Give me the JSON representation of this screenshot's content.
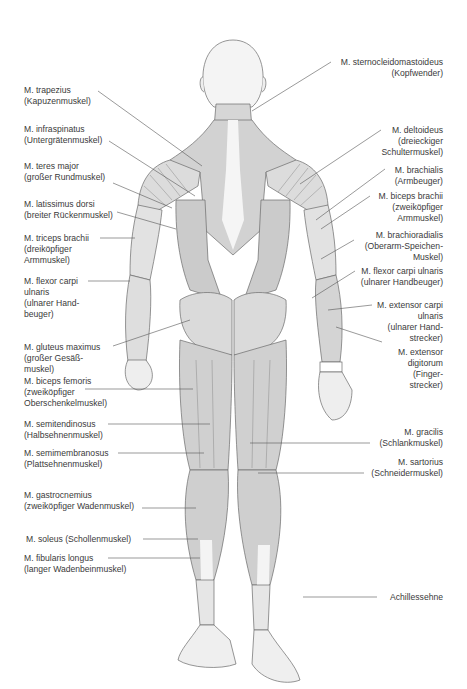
{
  "diagram": {
    "line_color": "#555555",
    "muscle_fill_dark": "#c9c9c9",
    "muscle_fill_light": "#e4e4e4",
    "skin_fill": "#f2f2f2",
    "labels_left": [
      {
        "id": "trapezius",
        "latin": "M. trapezius",
        "german": [
          "(Kapuzenmuskel)"
        ]
      },
      {
        "id": "infraspinatus",
        "latin": "M. infraspinatus",
        "german": [
          "(Untergrätenmuskel)"
        ]
      },
      {
        "id": "teres-major",
        "latin": "M. teres major",
        "german": [
          "(großer Rundmuskel)"
        ]
      },
      {
        "id": "latissimus-dorsi",
        "latin": "M. latissimus dorsi",
        "german": [
          "(breiter Rückenmuskel)"
        ]
      },
      {
        "id": "triceps-brachii",
        "latin": "M. triceps brachii",
        "german": [
          "(dreiköpfiger",
          "Armmuskel)"
        ]
      },
      {
        "id": "flexor-carpi-ulnaris-left",
        "latin": "M. flexor carpi",
        "german": [
          "ulnaris",
          "(ulnarer Hand-",
          "beuger)"
        ]
      },
      {
        "id": "gluteus-maximus",
        "latin": "M. gluteus maximus",
        "german": [
          "(großer Gesäß-",
          "muskel)"
        ]
      },
      {
        "id": "biceps-femoris",
        "latin": "M. biceps femoris",
        "german": [
          "(zweiköpfiger",
          "Oberschenkelmuskel)"
        ]
      },
      {
        "id": "semitendinosus",
        "latin": "M. semitendinosus",
        "german": [
          "(Halbsehnenmuskel)"
        ]
      },
      {
        "id": "semimembranosus",
        "latin": "M. semimembranosus",
        "german": [
          "(Plattsehnenmuskel)"
        ]
      },
      {
        "id": "gastrocnemius",
        "latin": "M. gastrocnemius",
        "german": [
          "(zweiköpfiger Wadenmuskel)"
        ]
      },
      {
        "id": "soleus",
        "latin": "M. soleus (Schollenmuskel)",
        "german": []
      },
      {
        "id": "fibularis-longus",
        "latin": "M. fibularis longus",
        "german": [
          "(langer Wadenbeinmuskel)"
        ]
      }
    ],
    "labels_right": [
      {
        "id": "sternocleidomastoideus",
        "latin": "M. sternocleidomastoideus",
        "german": [
          "(Kopfwender)"
        ]
      },
      {
        "id": "deltoideus",
        "latin": "M. deltoideus",
        "german": [
          "(dreieckiger",
          "Schultermuskel)"
        ]
      },
      {
        "id": "brachialis",
        "latin": "M. brachialis",
        "german": [
          "(Armbeuger)"
        ]
      },
      {
        "id": "biceps-brachii",
        "latin": "M. biceps brachii",
        "german": [
          "(zweiköpfiger",
          "Armmuskel)"
        ]
      },
      {
        "id": "brachioradialis",
        "latin": "M. brachioradialis",
        "german": [
          "(Oberarm-Speichen-",
          "Muskel)"
        ]
      },
      {
        "id": "flexor-carpi-ulnaris-right",
        "latin": "M. flexor carpi ulnaris",
        "german": [
          "(ulnarer Handbeuger)"
        ]
      },
      {
        "id": "extensor-carpi-ulnaris",
        "latin": "M. extensor carpi",
        "german": [
          "ulnaris",
          "(ulnarer Hand-",
          "strecker)"
        ]
      },
      {
        "id": "extensor-digitorum",
        "latin": "M. extensor",
        "german": [
          "digitorum",
          "(Finger-",
          "strecker)"
        ]
      },
      {
        "id": "gracilis",
        "latin": "M. gracilis",
        "german": [
          "(Schlankmuskel)"
        ]
      },
      {
        "id": "sartorius",
        "latin": "M. sartorius",
        "german": [
          "(Schneidermuskel)"
        ]
      },
      {
        "id": "achillessehne",
        "latin": "Achillessehne",
        "german": []
      }
    ]
  }
}
